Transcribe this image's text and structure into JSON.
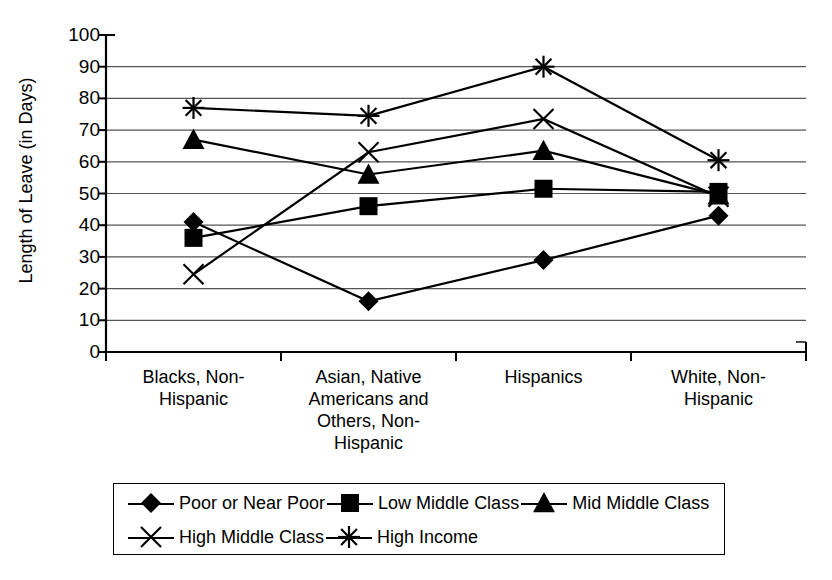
{
  "chart_data": {
    "type": "line",
    "title": "",
    "xlabel": "",
    "ylabel": "Length of Leave (in Days)",
    "ylim": [
      0,
      100
    ],
    "ytick_values": [
      0,
      10,
      20,
      30,
      40,
      50,
      60,
      70,
      80,
      90,
      100
    ],
    "ytick_labels": [
      "0",
      "10",
      "20",
      "30",
      "40",
      "50",
      "60",
      "70",
      "80",
      "90",
      "100"
    ],
    "grid": true,
    "legend_position": "bottom",
    "categories": [
      "Blacks, Non-Hispanic",
      "Asian, Native Americans and Others, Non-Hispanic",
      "Hispanics",
      "White, Non-Hispanic"
    ],
    "category_lines": [
      [
        "Blacks, Non-",
        "Hispanic"
      ],
      [
        "Asian, Native",
        "Americans and",
        "Others, Non-",
        "Hispanic"
      ],
      [
        "Hispanics"
      ],
      [
        "White, Non-",
        "Hispanic"
      ]
    ],
    "series": [
      {
        "name": "Poor or Near Poor",
        "marker": "diamond",
        "values": [
          41,
          16,
          29,
          43
        ]
      },
      {
        "name": "Low Middle Class",
        "marker": "square",
        "values": [
          36,
          46,
          51.5,
          50.5
        ]
      },
      {
        "name": "Mid Middle Class",
        "marker": "triangle",
        "values": [
          67,
          56,
          63.5,
          49.5
        ]
      },
      {
        "name": "High Middle Class",
        "marker": "x",
        "values": [
          24.5,
          63,
          73.5,
          49
        ]
      },
      {
        "name": "High Income",
        "marker": "asterisk",
        "values": [
          77,
          74.5,
          90,
          60.5
        ]
      }
    ]
  },
  "legend": {
    "rows": [
      [
        "Poor or Near Poor",
        "Low Middle Class",
        "Mid Middle Class"
      ],
      [
        "High Middle Class",
        "High Income"
      ]
    ]
  },
  "colors": {
    "line": "#000000",
    "grid": "#555555",
    "axis": "#000000",
    "background": "#ffffff"
  }
}
